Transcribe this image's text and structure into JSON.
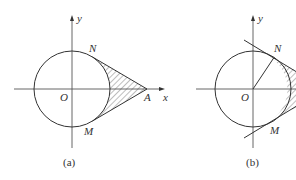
{
  "figures": [
    {
      "id": "a",
      "caption": "(a)",
      "labels": {
        "y_axis": "y",
        "x_axis": "x",
        "origin": "O",
        "upper_point": "N",
        "lower_point": "M",
        "external_point": "A"
      },
      "description": "Circle centered at origin O with external point A on the positive x-axis; tangent lines AN and AM; region between tangents and circle arc is hatched"
    },
    {
      "id": "b",
      "caption": "(b)",
      "labels": {
        "y_axis": "y",
        "origin": "O",
        "upper_point": "N",
        "lower_point": "M"
      },
      "description": "Circle centered at origin O with tangent lines at N and M extended; radius ON drawn; hatched region to the right of the circle between the tangents"
    }
  ],
  "colors": {
    "stroke": "#333333",
    "hatch": "#444444",
    "background": "#ffffff"
  }
}
